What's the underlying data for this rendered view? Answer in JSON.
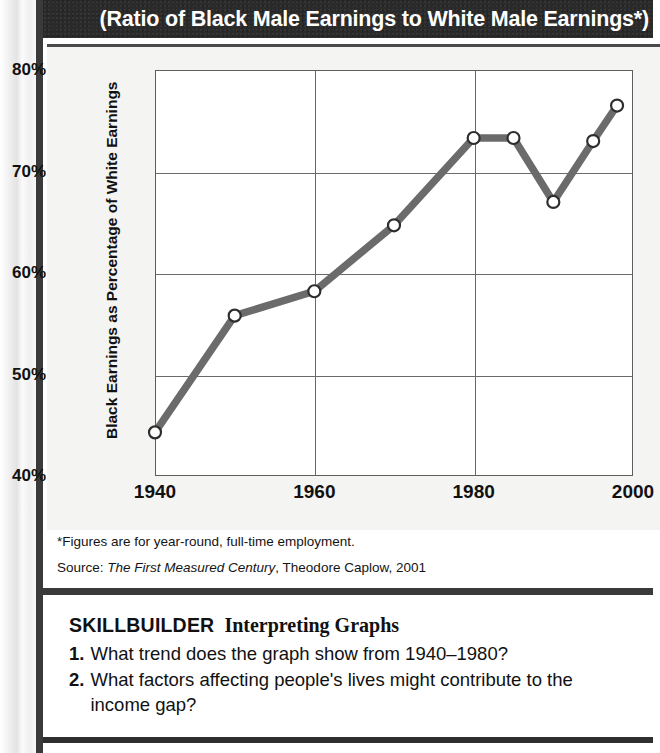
{
  "page": {
    "figure_title": "(Ratio of Black Male Earnings to White Male Earnings*)"
  },
  "chart_data": {
    "type": "line",
    "title": "(Ratio of Black Male Earnings to White Male Earnings*)",
    "xlabel": "",
    "ylabel": "Black Earnings as Percentage of White Earnings",
    "xlim": [
      1940,
      2000
    ],
    "ylim": [
      40,
      80
    ],
    "xticks": [
      "1940",
      "1960",
      "1980",
      "2000"
    ],
    "xtick_values": [
      1940,
      1960,
      1980,
      2000
    ],
    "yticks": [
      "40%",
      "50%",
      "60%",
      "70%",
      "80%"
    ],
    "ytick_values": [
      40,
      50,
      60,
      70,
      80
    ],
    "grid": true,
    "legend": "none",
    "marker": "open-circle",
    "line_color": "#6b6b6b",
    "x": [
      1940,
      1950,
      1960,
      1970,
      1980,
      1985,
      1990,
      1995,
      1998
    ],
    "values": [
      44.3,
      55.8,
      58.2,
      64.7,
      73.3,
      73.3,
      67.0,
      73.0,
      76.5
    ]
  },
  "notes": {
    "footnote": "*Figures are for year-round, full-time employment.",
    "source_prefix": "Source: ",
    "source_title": "The First Measured Century",
    "source_rest": ", Theodore Caplow, 2001"
  },
  "skillbuilder": {
    "label": "SKILLBUILDER",
    "subtitle": "Interpreting Graphs",
    "questions": [
      {
        "number": "1.",
        "text": "What trend does the graph show from 1940–1980?"
      },
      {
        "number": "2.",
        "text": "What factors affecting people's lives might contribute to the income gap?"
      }
    ]
  },
  "colors": {
    "header_bg": "#2b2a2a",
    "panel_bg": "#f4f4f2",
    "line": "#6b6b6b",
    "axis": "#5d5d5d"
  }
}
